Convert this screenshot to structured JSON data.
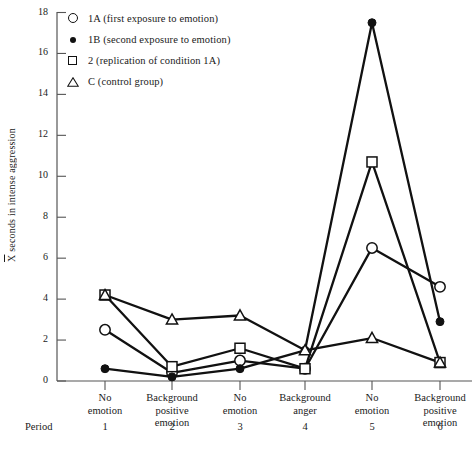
{
  "chart_data": {
    "type": "line",
    "title": "",
    "xlabel": "Period",
    "ylabel": "X̄ seconds in intense aggression",
    "ylim": [
      0,
      18
    ],
    "yticks": [
      0,
      2,
      4,
      6,
      8,
      10,
      12,
      14,
      16,
      18
    ],
    "grid": false,
    "legend_position": "top-left",
    "categories": [
      "No emotion",
      "Background positive emotion",
      "No emotion",
      "Background anger",
      "No emotion",
      "Background positive emotion"
    ],
    "x": [
      1,
      2,
      3,
      4,
      5,
      6
    ],
    "series": [
      {
        "name": "1A (first exposure to emotion)",
        "short": "1A",
        "marker": "circle-open",
        "values": [
          2.5,
          0.4,
          1.0,
          0.6,
          6.5,
          4.6
        ]
      },
      {
        "name": "1B (second exposure to emotion)",
        "short": "1B",
        "marker": "circle-filled",
        "values": [
          0.6,
          0.2,
          0.6,
          1.5,
          17.5,
          2.9
        ]
      },
      {
        "name": "2  (replication of condition 1A)",
        "short": "2",
        "marker": "square-open",
        "values": [
          4.2,
          0.7,
          1.6,
          0.6,
          10.7,
          0.9
        ]
      },
      {
        "name": "C  (control group)",
        "short": "C",
        "marker": "triangle-open",
        "values": [
          4.2,
          3.0,
          3.2,
          1.5,
          2.1,
          0.9
        ]
      }
    ]
  },
  "axis": {
    "ytick_labels": [
      "0",
      "2",
      "4",
      "6",
      "8",
      "10",
      "12",
      "14",
      "16",
      "18"
    ],
    "ylabel_bar": "X",
    "ylabel_rest": " seconds in intense aggression"
  },
  "xaxis": {
    "period_word": "Period",
    "period_numbers": [
      "1",
      "2",
      "3",
      "4",
      "5",
      "6"
    ],
    "category_lines": [
      [
        "No",
        "emotion"
      ],
      [
        "Background",
        "positive",
        "emotion"
      ],
      [
        "No",
        "emotion"
      ],
      [
        "Background",
        "anger"
      ],
      [
        "No",
        "emotion"
      ],
      [
        "Background",
        "positive",
        "emotion"
      ]
    ]
  },
  "legend": {
    "items": [
      {
        "marker": "circle-open",
        "label": "1A (first exposure to emotion)"
      },
      {
        "marker": "circle-filled",
        "label": "1B (second exposure to emotion)"
      },
      {
        "marker": "square-open",
        "label": "2  (replication of condition 1A)"
      },
      {
        "marker": "triangle-open",
        "label": "C  (control group)"
      }
    ]
  },
  "colors": {
    "ink": "#111111",
    "axis": "#555555",
    "background": "#ffffff"
  }
}
